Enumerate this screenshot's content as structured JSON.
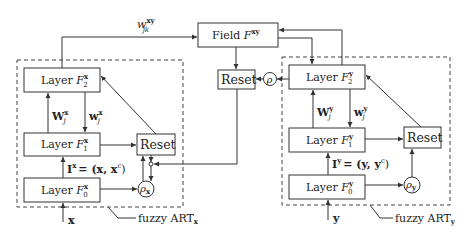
{
  "diagram": {
    "map_field": {
      "label": "Field",
      "symbol": "F",
      "superscript": "xy"
    },
    "map_weight": {
      "symbol": "w",
      "superscript": "xy",
      "subscript": "jk"
    },
    "map_reset": {
      "label": "Reset"
    },
    "map_vigilance": {
      "symbol": "ρ"
    },
    "art_x": {
      "caption": "fuzzy ART",
      "caption_sub": "x",
      "layers": [
        {
          "label": "Layer",
          "symbol": "F",
          "sup": "x",
          "sub": "2"
        },
        {
          "label": "Layer",
          "symbol": "F",
          "sup": "x",
          "sub": "1"
        },
        {
          "label": "Layer",
          "symbol": "F",
          "sup": "x",
          "sub": "0"
        }
      ],
      "bottom_up_weight": {
        "symbol": "W",
        "sup": "x",
        "sub": "j"
      },
      "top_down_weight": {
        "symbol": "w",
        "sup": "x",
        "sub": "j"
      },
      "input_eq": {
        "lhs": "I",
        "sup": "x",
        "rhs": "= (x, x",
        "rhs_sup": "c",
        "close": ")"
      },
      "reset": "Reset",
      "vigilance": {
        "symbol": "ρ",
        "sub": "x"
      },
      "input": "x"
    },
    "art_y": {
      "caption": "fuzzy ART",
      "caption_sub": "y",
      "layers": [
        {
          "label": "Layer",
          "symbol": "F",
          "sup": "y",
          "sub": "2"
        },
        {
          "label": "Layer",
          "symbol": "F",
          "sup": "y",
          "sub": "1"
        },
        {
          "label": "Layer",
          "symbol": "F",
          "sup": "y",
          "sub": "0"
        }
      ],
      "bottom_up_weight": {
        "symbol": "W",
        "sup": "y",
        "sub": "j"
      },
      "top_down_weight": {
        "symbol": "w",
        "sup": "y",
        "sub": "j"
      },
      "input_eq": {
        "lhs": "I",
        "sup": "y",
        "rhs": "= (y, y",
        "rhs_sup": "c",
        "close": ")"
      },
      "reset": "Reset",
      "vigilance": {
        "symbol": "ρ",
        "sub": "y"
      },
      "input": "y"
    }
  }
}
